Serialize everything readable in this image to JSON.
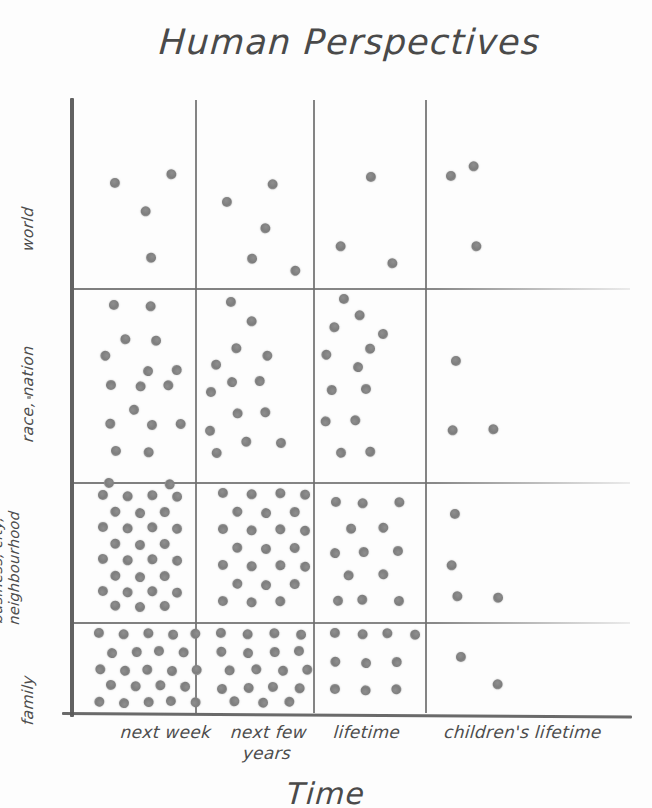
{
  "title": "Human Perspectives",
  "axes": {
    "x_title": "Time",
    "y_title": "",
    "x_ticks": [
      {
        "label": "next week",
        "label2": ""
      },
      {
        "label": "next few",
        "label2": "years"
      },
      {
        "label": "lifetime",
        "label2": ""
      },
      {
        "label": "children's lifetime",
        "label2": ""
      }
    ],
    "y_ticks": [
      {
        "label": "world",
        "label2": ""
      },
      {
        "label": "race, nation",
        "label2": ""
      },
      {
        "label": "business, city,",
        "label2": "neighbourhood"
      },
      {
        "label": "family",
        "label2": ""
      }
    ]
  },
  "colors": {
    "dot": "#7d7d7d",
    "grid": "#6e6e6e",
    "axis": "#555555",
    "text": "#4d4d4d",
    "background": "#fdfdfd"
  },
  "chart_data": {
    "type": "scatter",
    "title": "Human Perspectives",
    "xlabel": "Time",
    "ylabel": "",
    "grid": true,
    "legend": "none",
    "categories_x": [
      "next week",
      "next few years",
      "lifetime",
      "children's lifetime"
    ],
    "categories_y": [
      "family",
      "business, city, neighbourhood",
      "race, nation",
      "world"
    ],
    "cells": [
      {
        "x": "next week",
        "y": "world",
        "count": 4
      },
      {
        "x": "next few years",
        "y": "world",
        "count": 5
      },
      {
        "x": "lifetime",
        "y": "world",
        "count": 3
      },
      {
        "x": "children's lifetime",
        "y": "world",
        "count": 3
      },
      {
        "x": "next week",
        "y": "race, nation",
        "count": 16
      },
      {
        "x": "next few years",
        "y": "race, nation",
        "count": 14
      },
      {
        "x": "lifetime",
        "y": "race, nation",
        "count": 13
      },
      {
        "x": "children's lifetime",
        "y": "race, nation",
        "count": 3
      },
      {
        "x": "next week",
        "y": "business, city, neighbourhood",
        "count": 30
      },
      {
        "x": "next few years",
        "y": "business, city, neighbourhood",
        "count": 24
      },
      {
        "x": "lifetime",
        "y": "business, city, neighbourhood",
        "count": 13
      },
      {
        "x": "children's lifetime",
        "y": "business, city, neighbourhood",
        "count": 4
      },
      {
        "x": "next week",
        "y": "family",
        "count": 23
      },
      {
        "x": "next few years",
        "y": "family",
        "count": 19
      },
      {
        "x": "lifetime",
        "y": "family",
        "count": 10
      },
      {
        "x": "children's lifetime",
        "y": "family",
        "count": 2
      }
    ],
    "points": {
      "world_next_week": [
        [
          116,
          184
        ],
        [
          146,
          211
        ],
        [
          171,
          175
        ],
        [
          150,
          257
        ]
      ],
      "world_next_few_years": [
        [
          228,
          203
        ],
        [
          273,
          184
        ],
        [
          265,
          229
        ],
        [
          251,
          258
        ],
        [
          296,
          271
        ]
      ],
      "world_lifetime": [
        [
          372,
          178
        ],
        [
          341,
          246
        ],
        [
          392,
          264
        ]
      ],
      "world_children": [
        [
          452,
          177
        ],
        [
          474,
          166
        ],
        [
          476,
          247
        ]
      ],
      "race_next_week": [
        [
          115,
          306
        ],
        [
          151,
          306
        ],
        [
          125,
          340
        ],
        [
          155,
          340
        ],
        [
          106,
          356
        ],
        [
          148,
          370
        ],
        [
          176,
          370
        ],
        [
          112,
          386
        ],
        [
          141,
          386
        ],
        [
          168,
          386
        ],
        [
          133,
          409
        ],
        [
          111,
          424
        ],
        [
          152,
          424
        ],
        [
          180,
          424
        ],
        [
          117,
          452
        ],
        [
          149,
          452
        ]
      ],
      "race_next_few_years": [
        [
          232,
          303
        ],
        [
          252,
          321
        ],
        [
          236,
          349
        ],
        [
          215,
          364
        ],
        [
          268,
          356
        ],
        [
          232,
          381
        ],
        [
          259,
          381
        ],
        [
          212,
          393
        ],
        [
          238,
          413
        ],
        [
          265,
          413
        ],
        [
          209,
          430
        ],
        [
          247,
          442
        ],
        [
          281,
          442
        ],
        [
          216,
          453
        ]
      ],
      "race_lifetime": [
        [
          345,
          300
        ],
        [
          360,
          315
        ],
        [
          334,
          328
        ],
        [
          369,
          348
        ],
        [
          327,
          355
        ],
        [
          358,
          366
        ],
        [
          331,
          390
        ],
        [
          367,
          390
        ],
        [
          326,
          421
        ],
        [
          355,
          421
        ],
        [
          340,
          452
        ],
        [
          371,
          452
        ],
        [
          383,
          333
        ]
      ],
      "race_children": [
        [
          457,
          362
        ],
        [
          453,
          430
        ],
        [
          493,
          430
        ]
      ],
      "biz_next_week": [
        [
          104,
          496
        ],
        [
          128,
          496
        ],
        [
          152,
          496
        ],
        [
          176,
          496
        ],
        [
          116,
          512
        ],
        [
          140,
          512
        ],
        [
          164,
          512
        ],
        [
          104,
          528
        ],
        [
          128,
          528
        ],
        [
          152,
          528
        ],
        [
          176,
          528
        ],
        [
          116,
          544
        ],
        [
          140,
          544
        ],
        [
          164,
          544
        ],
        [
          104,
          560
        ],
        [
          128,
          560
        ],
        [
          152,
          560
        ],
        [
          176,
          560
        ],
        [
          116,
          576
        ],
        [
          140,
          576
        ],
        [
          164,
          576
        ],
        [
          104,
          592
        ],
        [
          128,
          592
        ],
        [
          152,
          592
        ],
        [
          176,
          592
        ],
        [
          116,
          606
        ],
        [
          140,
          606
        ],
        [
          164,
          606
        ],
        [
          110,
          484
        ],
        [
          170,
          484
        ]
      ],
      "biz_next_few_years": [
        [
          224,
          494
        ],
        [
          252,
          494
        ],
        [
          280,
          494
        ],
        [
          304,
          494
        ],
        [
          238,
          512
        ],
        [
          266,
          512
        ],
        [
          294,
          512
        ],
        [
          224,
          530
        ],
        [
          252,
          530
        ],
        [
          280,
          530
        ],
        [
          304,
          530
        ],
        [
          238,
          548
        ],
        [
          266,
          548
        ],
        [
          294,
          548
        ],
        [
          224,
          566
        ],
        [
          252,
          566
        ],
        [
          280,
          566
        ],
        [
          304,
          566
        ],
        [
          238,
          584
        ],
        [
          266,
          584
        ],
        [
          294,
          584
        ],
        [
          224,
          602
        ],
        [
          252,
          602
        ],
        [
          280,
          602
        ]
      ],
      "biz_lifetime": [
        [
          337,
          503
        ],
        [
          363,
          503
        ],
        [
          399,
          503
        ],
        [
          350,
          528
        ],
        [
          384,
          528
        ],
        [
          335,
          552
        ],
        [
          363,
          552
        ],
        [
          399,
          552
        ],
        [
          349,
          575
        ],
        [
          383,
          575
        ],
        [
          337,
          600
        ],
        [
          363,
          600
        ],
        [
          399,
          600
        ]
      ],
      "biz_children": [
        [
          456,
          515
        ],
        [
          452,
          565
        ],
        [
          457,
          597
        ],
        [
          497,
          597
        ]
      ],
      "family_next_week": [
        [
          100,
          634
        ],
        [
          124,
          634
        ],
        [
          148,
          634
        ],
        [
          172,
          634
        ],
        [
          196,
          634
        ],
        [
          112,
          652
        ],
        [
          136,
          652
        ],
        [
          160,
          652
        ],
        [
          184,
          652
        ],
        [
          100,
          670
        ],
        [
          124,
          670
        ],
        [
          148,
          670
        ],
        [
          172,
          670
        ],
        [
          196,
          670
        ],
        [
          112,
          686
        ],
        [
          136,
          686
        ],
        [
          160,
          686
        ],
        [
          184,
          686
        ],
        [
          100,
          702
        ],
        [
          124,
          702
        ],
        [
          148,
          702
        ],
        [
          172,
          702
        ],
        [
          196,
          702
        ]
      ],
      "family_next_few_years": [
        [
          222,
          634
        ],
        [
          248,
          634
        ],
        [
          274,
          634
        ],
        [
          300,
          634
        ],
        [
          222,
          652
        ],
        [
          248,
          652
        ],
        [
          274,
          652
        ],
        [
          300,
          652
        ],
        [
          230,
          670
        ],
        [
          256,
          670
        ],
        [
          282,
          670
        ],
        [
          308,
          670
        ],
        [
          222,
          688
        ],
        [
          248,
          688
        ],
        [
          274,
          688
        ],
        [
          300,
          688
        ],
        [
          234,
          702
        ],
        [
          262,
          702
        ],
        [
          290,
          702
        ]
      ],
      "family_lifetime": [
        [
          336,
          634
        ],
        [
          363,
          634
        ],
        [
          387,
          634
        ],
        [
          414,
          634
        ],
        [
          336,
          662
        ],
        [
          366,
          662
        ],
        [
          396,
          662
        ],
        [
          336,
          690
        ],
        [
          366,
          690
        ],
        [
          396,
          690
        ]
      ],
      "family_children": [
        [
          462,
          658
        ],
        [
          498,
          684
        ]
      ]
    }
  },
  "layout": {
    "plot_left": 74,
    "plot_top": 100,
    "plot_right": 630,
    "plot_bottom": 713,
    "v_dividers": [
      195,
      313,
      425
    ],
    "h_dividers": [
      288,
      482,
      622
    ]
  }
}
